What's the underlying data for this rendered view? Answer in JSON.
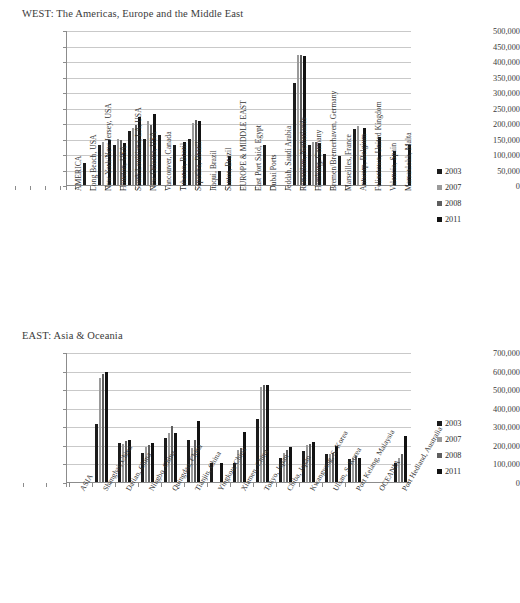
{
  "page": {
    "background": "#ffffff"
  },
  "series_colors": {
    "2003": "#1c1c1c",
    "2007": "#9a9a9a",
    "2008": "#5e5e5e",
    "2011": "#121212"
  },
  "legend": {
    "position": "right",
    "entries": [
      {
        "label": "2003",
        "color": "#1c1c1c"
      },
      {
        "label": "2007",
        "color": "#9a9a9a"
      },
      {
        "label": "2008",
        "color": "#5e5e5e"
      },
      {
        "label": "2011",
        "color": "#121212"
      }
    ]
  },
  "chart_data": [
    {
      "id": "west",
      "type": "bar",
      "title": "WEST: The Americas, Europe and the Middle East",
      "xlabel": "",
      "ylabel": "",
      "ylim": [
        0,
        500000
      ],
      "ytick_step": 50000,
      "grid": true,
      "legend_position": "right",
      "ytick_labels": [
        "500,000",
        "450,000",
        "400,000",
        "350,000",
        "300,000",
        "250,000",
        "200,000",
        "150,000",
        "100,000",
        "50,000",
        "0"
      ],
      "categories": [
        "AMERICA",
        "Long Beach, USA",
        "New York/New Jersey, USA",
        "Houston, USA",
        "South Louisiana, LA, USA",
        "New Orleans, USA",
        "Vancouver, Canada",
        "Tubarao, Brazil",
        "Sepetiba, Brazil",
        "Itaqui, Brazil",
        "Santos, Brazil",
        "EUROPE & MIDDLE EAST",
        "East Port Said, Egypt",
        "Dubai Ports",
        "Jeddah, Saudi Arabia",
        "Rotterdam, Netherlands",
        "Hamburg, Germany",
        "Bremen/Bremerhaven, Germany",
        "Marseilles, France",
        "Antwerp, Belgium",
        "Felixstowe, United Kingdom",
        "Valencia, Spain",
        "Marsaxlokk, Malta"
      ],
      "series": [
        {
          "name": "2003",
          "values": [
            0,
            70000,
            130000,
            130000,
            175000,
            150000,
            160000,
            130000,
            150000,
            0,
            45000,
            0,
            0,
            130000,
            0,
            330000,
            130000,
            100000,
            95000,
            180000,
            0,
            0,
            0
          ]
        },
        {
          "name": "2007",
          "values": [
            0,
            0,
            140000,
            150000,
            185000,
            205000,
            0,
            0,
            200000,
            0,
            0,
            0,
            0,
            0,
            0,
            420000,
            140000,
            0,
            0,
            190000,
            0,
            0,
            0
          ]
        },
        {
          "name": "2008",
          "values": [
            0,
            0,
            0,
            145000,
            195000,
            195000,
            0,
            0,
            210000,
            0,
            0,
            0,
            0,
            0,
            0,
            420000,
            140000,
            0,
            0,
            0,
            0,
            0,
            0
          ]
        },
        {
          "name": "2011",
          "values": [
            0,
            0,
            145000,
            135000,
            220000,
            230000,
            0,
            140000,
            205000,
            0,
            95000,
            0,
            0,
            0,
            0,
            415000,
            135000,
            0,
            0,
            185000,
            155000,
            110000,
            130000
          ]
        }
      ]
    },
    {
      "id": "east",
      "type": "bar",
      "title": "EAST: Asia & Oceania",
      "xlabel": "",
      "ylabel": "",
      "ylim": [
        0,
        700000
      ],
      "ytick_step": 100000,
      "grid": true,
      "legend_position": "right",
      "ytick_labels": [
        "700,000",
        "600,000",
        "500,000",
        "400,000",
        "300,000",
        "200,000",
        "100,000",
        "0"
      ],
      "categories": [
        "ASIA",
        "Shanghai, China",
        "Dalian, China",
        "Ningbo, China",
        "Quingdao, China",
        "Tianjin, China",
        "Yingkou, China",
        "Xiamen, China",
        "Tokyo, Japan",
        "Chiba, Japan",
        "Kwangyang, S. Korea",
        "Ulsan, S. Korea",
        "Port Kelang, Malaysia",
        "OCEANIA",
        "Port Hedland, Australia"
      ],
      "series": [
        {
          "name": "2003",
          "values": [
            0,
            310000,
            210000,
            155000,
            235000,
            225000,
            100000,
            105000,
            340000,
            130000,
            165000,
            150000,
            125000,
            0,
            105000
          ]
        },
        {
          "name": "2007",
          "values": [
            0,
            560000,
            205000,
            190000,
            265000,
            185000,
            0,
            175000,
            510000,
            155000,
            200000,
            150000,
            130000,
            0,
            130000
          ]
        },
        {
          "name": "2008",
          "values": [
            0,
            580000,
            220000,
            200000,
            300000,
            225000,
            0,
            185000,
            520000,
            175000,
            205000,
            155000,
            140000,
            0,
            150000
          ]
        },
        {
          "name": "2011",
          "values": [
            0,
            590000,
            225000,
            210000,
            265000,
            330000,
            105000,
            270000,
            520000,
            190000,
            215000,
            195000,
            130000,
            0,
            250000
          ]
        }
      ]
    }
  ]
}
